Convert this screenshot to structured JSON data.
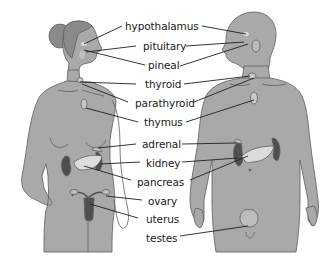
{
  "diagram": {
    "colors": {
      "skin": "#a9a9a9",
      "skin_outline": "#5e5e5e",
      "hair": "#8a8a8a",
      "organ_dark": "#4f4f4f",
      "organ_light": "#dcdcdc",
      "line": "#1f1f1f",
      "background": "#ffffff"
    },
    "figures": [
      {
        "name": "female",
        "position": "left"
      },
      {
        "name": "male",
        "position": "right"
      }
    ],
    "labels": [
      {
        "id": "hypothalamus",
        "text": "hypothalamus"
      },
      {
        "id": "pituitary",
        "text": "pituitary"
      },
      {
        "id": "pineal",
        "text": "pineal"
      },
      {
        "id": "thyroid",
        "text": "thyroid"
      },
      {
        "id": "parathyroid",
        "text": "parathyroid"
      },
      {
        "id": "thymus",
        "text": "thymus"
      },
      {
        "id": "adrenal",
        "text": "adrenal"
      },
      {
        "id": "kidney",
        "text": "kidney"
      },
      {
        "id": "pancreas",
        "text": "pancreas"
      },
      {
        "id": "ovary",
        "text": "ovary"
      },
      {
        "id": "uterus",
        "text": "uterus"
      },
      {
        "id": "testes",
        "text": "testes"
      }
    ]
  }
}
